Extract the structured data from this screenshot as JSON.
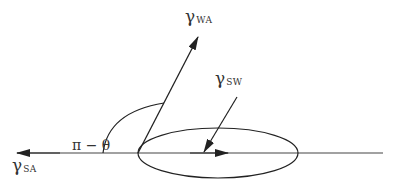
{
  "diagram": {
    "type": "contact-angle force balance",
    "colors": {
      "line": "#222222",
      "text": "#333333",
      "background": "#ffffff"
    },
    "labels": {
      "gamma_sa": {
        "symbol": "γ",
        "subscript": "SA"
      },
      "gamma_wa": {
        "symbol": "γ",
        "subscript": "WA"
      },
      "gamma_sw": {
        "symbol": "γ",
        "subscript": "SW"
      },
      "angle": "π − θ"
    },
    "vectors": [
      {
        "name": "gamma_SA",
        "from": [
          138,
          153
        ],
        "to": [
          17,
          153
        ]
      },
      {
        "name": "gamma_WA",
        "from": [
          138,
          153
        ],
        "to": [
          198,
          37
        ]
      },
      {
        "name": "gamma_SW",
        "from": [
          237,
          97
        ],
        "to": [
          204,
          152
        ]
      },
      {
        "name": "inner_arrow",
        "from": [
          138,
          153
        ],
        "to": [
          228,
          153
        ]
      }
    ],
    "baseline": {
      "from": [
        17,
        153
      ],
      "to": [
        383,
        153
      ]
    },
    "ellipse": {
      "cx": 218,
      "cy": 153,
      "rx": 80,
      "ry": 25
    },
    "angle_arc": {
      "from": [
        103,
        153
      ],
      "to": [
        164,
        103
      ]
    }
  }
}
